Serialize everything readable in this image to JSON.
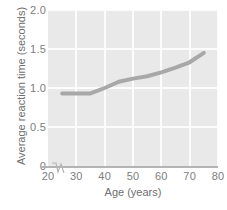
{
  "chart_data": {
    "type": "line",
    "title": "",
    "xlabel": "Age (years)",
    "ylabel": "Average reaction time (seconds)",
    "xlim": [
      20,
      80
    ],
    "ylim": [
      0,
      2.0
    ],
    "xticks": [
      20,
      30,
      40,
      50,
      60,
      70,
      80
    ],
    "xtick_labels": [
      "20",
      "30",
      "40",
      "50",
      "60",
      "70",
      "80"
    ],
    "yticks": [
      0,
      0.5,
      1.0,
      1.5,
      2.0
    ],
    "ytick_labels": [
      "0",
      "0.5",
      "1.0",
      "1.5",
      "2.0"
    ],
    "grid": true,
    "grid_color": "#fcfcfc",
    "plot_background": "#e9e9e9",
    "axis_break": true,
    "legend": null,
    "series": [
      {
        "name": "Average reaction time",
        "color": "#a8a8a8",
        "line_width": 4,
        "x": [
          25,
          30,
          35,
          40,
          45,
          50,
          55,
          60,
          65,
          70,
          75
        ],
        "y": [
          0.93,
          0.93,
          0.93,
          1.0,
          1.08,
          1.12,
          1.15,
          1.2,
          1.26,
          1.33,
          1.45
        ]
      }
    ]
  },
  "axis": {
    "x_title": "Age (years)",
    "y_title": "Average reaction time (seconds)"
  },
  "colors": {
    "line": "#a8a8a8",
    "plot_bg": "#e9e9e9",
    "grid": "#fcfcfc",
    "axis": "#b4b4b4",
    "tick_text": "#7d7d7d",
    "title_text": "#6e6e6e"
  }
}
